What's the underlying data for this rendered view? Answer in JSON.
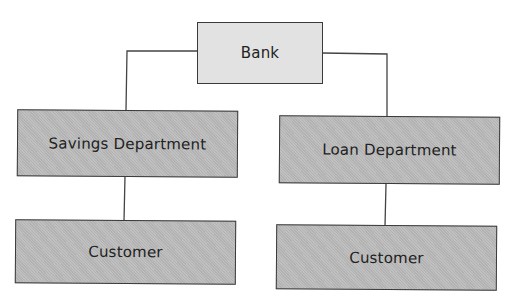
{
  "diagram": {
    "type": "organization-hierarchy",
    "root": {
      "label": "Bank"
    },
    "departments": [
      {
        "label": "Savings Department",
        "child": {
          "label": "Customer"
        }
      },
      {
        "label": "Loan Department",
        "child": {
          "label": "Customer"
        }
      }
    ],
    "edges": [
      {
        "from": "Bank",
        "to": "Savings Department"
      },
      {
        "from": "Bank",
        "to": "Loan Department"
      },
      {
        "from": "Savings Department",
        "to": "Customer"
      },
      {
        "from": "Loan Department",
        "to": "Customer"
      }
    ],
    "colors": {
      "root_fill": "#e2e2e2",
      "node_fill": "#b9b9b9",
      "border": "#3a3a3a",
      "line": "#444444",
      "text": "#222222"
    }
  }
}
